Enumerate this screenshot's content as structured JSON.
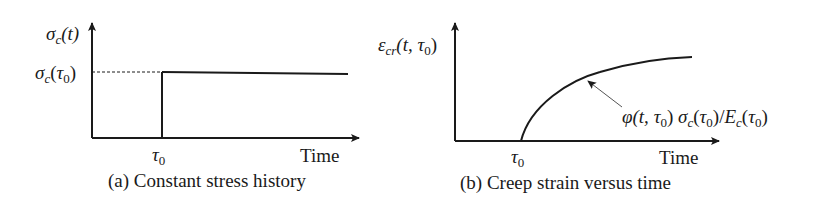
{
  "panels": [
    {
      "id": "a",
      "y_axis_label": {
        "symbol": "σ",
        "sub": "c",
        "arg": "(t)"
      },
      "y_level_label": {
        "symbol": "σ",
        "sub": "c",
        "arg_open": "(",
        "tau": "τ",
        "tau_sub": "0",
        "arg_close": ")"
      },
      "x_tick_label": {
        "tau": "τ",
        "tau_sub": "0"
      },
      "x_axis_label": "Time",
      "caption": "(a) Constant stress history"
    },
    {
      "id": "b",
      "y_axis_label": {
        "symbol": "ε",
        "sub": "cr",
        "arg_open": "(t, ",
        "tau": "τ",
        "tau_sub": "0",
        "arg_close": ")"
      },
      "curve_annotation": {
        "phi": "φ",
        "phi_args_open": "(t, ",
        "tau": "τ",
        "tau_sub": "0",
        "phi_args_close": ") ",
        "sigma": "σ",
        "sigma_sub": "c",
        "sigma_open": "(",
        "sigma_close": ")/",
        "E": "E",
        "E_sub": "c",
        "E_open": "(",
        "E_close": ")"
      },
      "x_tick_label": {
        "tau": "τ",
        "tau_sub": "0"
      },
      "x_axis_label": "Time",
      "caption": "(b) Creep strain versus time"
    }
  ],
  "colors": {
    "line": "#1a1a1a",
    "arrow_leader": "#555555"
  }
}
